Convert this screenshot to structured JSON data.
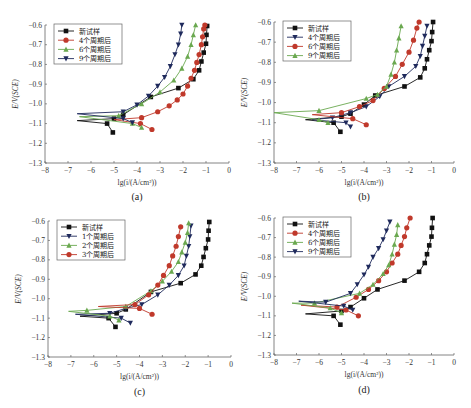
{
  "chart_data": [
    {
      "type": "line",
      "panel_label": "(a)",
      "xlabel": "lg(i/(A/cm²))",
      "ylabel": "E/V(SCE)",
      "xlim": [
        -8,
        0
      ],
      "ylim": [
        -1.3,
        -0.6
      ],
      "xticks": [
        "-8",
        "-7",
        "-6",
        "-5",
        "-4",
        "-3",
        "-2",
        "-1",
        "0"
      ],
      "yticks": [
        "-0.6",
        "-0.7",
        "-0.8",
        "-0.9",
        "-1.0",
        "-1.1",
        "-1.2",
        "-1.3"
      ],
      "legend_position": "top-left",
      "series": [
        {
          "name": "新试样",
          "color": "#111111",
          "marker": "square",
          "points": [
            [
              -5.05,
              -1.145
            ],
            [
              -5.3,
              -1.1
            ],
            [
              -6.6,
              -1.085
            ],
            [
              -5.0,
              -1.075
            ],
            [
              -4.6,
              -1.055
            ],
            [
              -3.4,
              -0.965
            ],
            [
              -2.2,
              -0.92
            ],
            [
              -1.55,
              -0.875
            ],
            [
              -1.3,
              -0.83
            ],
            [
              -1.2,
              -0.785
            ],
            [
              -1.1,
              -0.74
            ],
            [
              -1.0,
              -0.695
            ],
            [
              -0.98,
              -0.65
            ],
            [
              -0.95,
              -0.605
            ]
          ]
        },
        {
          "name": "4个周期后",
          "color": "#c0392b",
          "marker": "circle",
          "points": [
            [
              -3.35,
              -1.13
            ],
            [
              -3.85,
              -1.1
            ],
            [
              -5.0,
              -1.08
            ],
            [
              -3.8,
              -1.07
            ],
            [
              -3.1,
              -1.04
            ],
            [
              -2.6,
              -1.01
            ],
            [
              -2.25,
              -0.98
            ],
            [
              -2.0,
              -0.95
            ],
            [
              -1.8,
              -0.91
            ],
            [
              -1.65,
              -0.87
            ],
            [
              -1.5,
              -0.83
            ],
            [
              -1.4,
              -0.79
            ],
            [
              -1.3,
              -0.75
            ],
            [
              -1.2,
              -0.7
            ],
            [
              -1.15,
              -0.66
            ],
            [
              -1.1,
              -0.62
            ],
            [
              -1.05,
              -0.6
            ]
          ]
        },
        {
          "name": "6个周期后",
          "color": "#6aa84f",
          "marker": "triangle-up",
          "points": [
            [
              -3.8,
              -1.12
            ],
            [
              -4.2,
              -1.1
            ],
            [
              -6.5,
              -1.065
            ],
            [
              -4.8,
              -1.06
            ],
            [
              -3.8,
              -1.0
            ],
            [
              -3.0,
              -0.94
            ],
            [
              -2.4,
              -0.88
            ],
            [
              -2.05,
              -0.82
            ],
            [
              -1.8,
              -0.76
            ],
            [
              -1.65,
              -0.7
            ],
            [
              -1.55,
              -0.65
            ],
            [
              -1.45,
              -0.6
            ]
          ]
        },
        {
          "name": "9个周期后",
          "color": "#1f2a5c",
          "marker": "triangle-down",
          "points": [
            [
              -4.2,
              -1.095
            ],
            [
              -4.6,
              -1.075
            ],
            [
              -6.6,
              -1.05
            ],
            [
              -4.6,
              -1.04
            ],
            [
              -4.0,
              -1.005
            ],
            [
              -3.5,
              -0.96
            ],
            [
              -3.1,
              -0.91
            ],
            [
              -2.8,
              -0.865
            ],
            [
              -2.55,
              -0.81
            ],
            [
              -2.35,
              -0.75
            ],
            [
              -2.2,
              -0.7
            ],
            [
              -2.1,
              -0.645
            ],
            [
              -2.05,
              -0.6
            ]
          ]
        }
      ]
    },
    {
      "type": "line",
      "panel_label": "(b)",
      "xlabel": "lg(i/(A/cm²))",
      "ylabel": "E/V(SCE)",
      "xlim": [
        -8,
        0
      ],
      "ylim": [
        -1.3,
        -0.6
      ],
      "xticks": [
        "-8",
        "-7",
        "-6",
        "-5",
        "-4",
        "-3",
        "-2",
        "-1",
        "0"
      ],
      "yticks": [
        "-0.6",
        "-0.7",
        "-0.8",
        "-0.9",
        "-1.0",
        "-1.1",
        "-1.2",
        "-1.3"
      ],
      "legend_position": "top-left",
      "series": [
        {
          "name": "新试样",
          "color": "#111111",
          "marker": "square",
          "points": [
            [
              -5.05,
              -1.145
            ],
            [
              -5.35,
              -1.1
            ],
            [
              -6.6,
              -1.085
            ],
            [
              -5.0,
              -1.07
            ],
            [
              -4.6,
              -1.055
            ],
            [
              -4.0,
              -1.01
            ],
            [
              -3.5,
              -0.965
            ],
            [
              -2.2,
              -0.92
            ],
            [
              -1.5,
              -0.875
            ],
            [
              -1.3,
              -0.83
            ],
            [
              -1.2,
              -0.785
            ],
            [
              -1.1,
              -0.74
            ],
            [
              -1.0,
              -0.695
            ],
            [
              -0.97,
              -0.65
            ],
            [
              -0.93,
              -0.6
            ]
          ]
        },
        {
          "name": "4个周期后",
          "color": "#1f2a5c",
          "marker": "triangle-down",
          "points": [
            [
              -4.6,
              -1.12
            ],
            [
              -4.8,
              -1.1
            ],
            [
              -6.3,
              -1.085
            ],
            [
              -5.4,
              -1.075
            ],
            [
              -4.6,
              -1.05
            ],
            [
              -3.9,
              -1.02
            ],
            [
              -3.3,
              -0.97
            ],
            [
              -2.9,
              -0.92
            ],
            [
              -2.2,
              -0.87
            ],
            [
              -1.7,
              -0.82
            ],
            [
              -1.5,
              -0.77
            ],
            [
              -1.4,
              -0.72
            ],
            [
              -1.3,
              -0.67
            ],
            [
              -1.2,
              -0.62
            ]
          ]
        },
        {
          "name": "6个周期后",
          "color": "#c0392b",
          "marker": "circle",
          "points": [
            [
              -3.9,
              -1.11
            ],
            [
              -4.5,
              -1.08
            ],
            [
              -6.3,
              -1.06
            ],
            [
              -5.0,
              -1.05
            ],
            [
              -4.2,
              -1.02
            ],
            [
              -3.6,
              -0.99
            ],
            [
              -3.1,
              -0.93
            ],
            [
              -2.6,
              -0.87
            ],
            [
              -2.3,
              -0.81
            ],
            [
              -2.0,
              -0.75
            ],
            [
              -1.8,
              -0.69
            ],
            [
              -1.65,
              -0.63
            ],
            [
              -1.55,
              -0.6
            ]
          ]
        },
        {
          "name": "9个周期后",
          "color": "#6aa84f",
          "marker": "triangle-up",
          "points": [
            [
              -5.6,
              -1.1
            ],
            [
              -6.0,
              -1.085
            ],
            [
              -8.0,
              -1.05
            ],
            [
              -6.0,
              -1.04
            ],
            [
              -3.9,
              -0.98
            ],
            [
              -3.4,
              -0.96
            ],
            [
              -3.0,
              -0.92
            ],
            [
              -2.8,
              -0.86
            ],
            [
              -2.65,
              -0.8
            ],
            [
              -2.55,
              -0.74
            ],
            [
              -2.45,
              -0.68
            ],
            [
              -2.35,
              -0.62
            ]
          ]
        }
      ]
    },
    {
      "type": "line",
      "panel_label": "(c)",
      "xlabel": "lg(i/(A/cm²))",
      "ylabel": "E/V(SCE)",
      "xlim": [
        -8,
        0
      ],
      "ylim": [
        -1.3,
        -0.6
      ],
      "xticks": [
        "-8",
        "-7",
        "-6",
        "-5",
        "-4",
        "-3",
        "-2",
        "-1",
        "0"
      ],
      "yticks": [
        "-0.6",
        "-0.7",
        "-0.8",
        "-0.9",
        "-1.0",
        "-1.1",
        "-1.2",
        "-1.3"
      ],
      "legend_position": "top-left",
      "series": [
        {
          "name": "新试样",
          "color": "#111111",
          "marker": "square",
          "points": [
            [
              -5.05,
              -1.145
            ],
            [
              -5.35,
              -1.1
            ],
            [
              -6.6,
              -1.09
            ],
            [
              -5.0,
              -1.075
            ],
            [
              -4.6,
              -1.055
            ],
            [
              -3.5,
              -0.965
            ],
            [
              -2.2,
              -0.92
            ],
            [
              -1.55,
              -0.875
            ],
            [
              -1.3,
              -0.83
            ],
            [
              -1.2,
              -0.785
            ],
            [
              -1.1,
              -0.74
            ],
            [
              -1.0,
              -0.695
            ],
            [
              -0.98,
              -0.65
            ],
            [
              -0.95,
              -0.605
            ]
          ]
        },
        {
          "name": "1个周期后",
          "color": "#1f2a5c",
          "marker": "triangle-down",
          "points": [
            [
              -4.4,
              -1.125
            ],
            [
              -4.8,
              -1.1
            ],
            [
              -6.8,
              -1.08
            ],
            [
              -5.3,
              -1.075
            ],
            [
              -4.6,
              -1.05
            ],
            [
              -3.9,
              -1.03
            ],
            [
              -3.2,
              -0.98
            ],
            [
              -2.7,
              -0.93
            ],
            [
              -2.3,
              -0.88
            ],
            [
              -2.05,
              -0.83
            ],
            [
              -1.95,
              -0.78
            ],
            [
              -1.85,
              -0.73
            ],
            [
              -1.8,
              -0.68
            ],
            [
              -1.75,
              -0.625
            ]
          ]
        },
        {
          "name": "2个周期后",
          "color": "#6aa84f",
          "marker": "triangle-up",
          "points": [
            [
              -4.9,
              -1.11
            ],
            [
              -5.3,
              -1.09
            ],
            [
              -7.1,
              -1.065
            ],
            [
              -6.3,
              -1.06
            ],
            [
              -4.6,
              -1.04
            ],
            [
              -3.5,
              -0.96
            ],
            [
              -3.0,
              -0.91
            ],
            [
              -2.6,
              -0.86
            ],
            [
              -2.3,
              -0.81
            ],
            [
              -2.15,
              -0.76
            ],
            [
              -2.0,
              -0.71
            ],
            [
              -1.9,
              -0.66
            ],
            [
              -1.85,
              -0.61
            ]
          ]
        },
        {
          "name": "3个周期后",
          "color": "#c0392b",
          "marker": "circle",
          "points": [
            [
              -3.45,
              -1.08
            ],
            [
              -4.0,
              -1.05
            ],
            [
              -5.8,
              -1.04
            ],
            [
              -4.2,
              -1.03
            ],
            [
              -3.6,
              -0.98
            ],
            [
              -3.2,
              -0.93
            ],
            [
              -2.95,
              -0.88
            ],
            [
              -2.7,
              -0.83
            ],
            [
              -2.55,
              -0.78
            ],
            [
              -2.4,
              -0.73
            ],
            [
              -2.3,
              -0.68
            ],
            [
              -2.2,
              -0.63
            ]
          ]
        }
      ]
    },
    {
      "type": "line",
      "panel_label": "(d)",
      "xlabel": "lg(i/(A/cm²))",
      "ylabel": "E/V(SCE)",
      "xlim": [
        -8,
        0
      ],
      "ylim": [
        -1.3,
        -0.6
      ],
      "xticks": [
        "-8",
        "-7",
        "-6",
        "-5",
        "-4",
        "-3",
        "-2",
        "-1",
        "0"
      ],
      "yticks": [
        "-0.6",
        "-0.7",
        "-0.8",
        "-0.9",
        "-1.0",
        "-1.1",
        "-1.2",
        "-1.3"
      ],
      "legend_position": "top-left",
      "series": [
        {
          "name": "新试样",
          "color": "#111111",
          "marker": "square",
          "points": [
            [
              -5.05,
              -1.145
            ],
            [
              -5.35,
              -1.1
            ],
            [
              -6.6,
              -1.09
            ],
            [
              -5.0,
              -1.075
            ],
            [
              -4.6,
              -1.055
            ],
            [
              -4.0,
              -1.01
            ],
            [
              -3.4,
              -0.965
            ],
            [
              -2.2,
              -0.92
            ],
            [
              -1.55,
              -0.875
            ],
            [
              -1.3,
              -0.83
            ],
            [
              -1.2,
              -0.785
            ],
            [
              -1.1,
              -0.74
            ],
            [
              -1.0,
              -0.695
            ],
            [
              -0.98,
              -0.65
            ],
            [
              -0.95,
              -0.6
            ]
          ]
        },
        {
          "name": "4个周期后",
          "color": "#c0392b",
          "marker": "circle",
          "points": [
            [
              -4.25,
              -1.1
            ],
            [
              -4.8,
              -1.07
            ],
            [
              -6.8,
              -1.045
            ],
            [
              -5.2,
              -1.055
            ],
            [
              -4.35,
              -1.005
            ],
            [
              -3.8,
              -0.965
            ],
            [
              -3.35,
              -0.92
            ],
            [
              -3.0,
              -0.875
            ],
            [
              -2.75,
              -0.83
            ],
            [
              -2.5,
              -0.785
            ],
            [
              -2.35,
              -0.74
            ],
            [
              -2.2,
              -0.695
            ],
            [
              -2.1,
              -0.65
            ],
            [
              -1.95,
              -0.6
            ]
          ]
        },
        {
          "name": "6个周期后",
          "color": "#6aa84f",
          "marker": "triangle-up",
          "points": [
            [
              -5.0,
              -1.085
            ],
            [
              -5.5,
              -1.06
            ],
            [
              -7.2,
              -1.035
            ],
            [
              -6.2,
              -1.035
            ],
            [
              -4.2,
              -0.985
            ],
            [
              -3.6,
              -0.94
            ],
            [
              -3.15,
              -0.885
            ],
            [
              -2.9,
              -0.84
            ],
            [
              -2.75,
              -0.785
            ],
            [
              -2.65,
              -0.735
            ],
            [
              -2.55,
              -0.685
            ],
            [
              -2.5,
              -0.635
            ]
          ]
        },
        {
          "name": "9个周期后",
          "color": "#1f2a5c",
          "marker": "triangle-down",
          "points": [
            [
              -4.5,
              -1.07
            ],
            [
              -4.9,
              -1.05
            ],
            [
              -6.9,
              -1.025
            ],
            [
              -5.7,
              -1.03
            ],
            [
              -4.6,
              -0.985
            ],
            [
              -4.3,
              -0.94
            ],
            [
              -4.0,
              -0.89
            ],
            [
              -3.8,
              -0.85
            ],
            [
              -3.6,
              -0.8
            ],
            [
              -3.35,
              -0.755
            ],
            [
              -3.15,
              -0.71
            ],
            [
              -3.0,
              -0.665
            ],
            [
              -2.85,
              -0.62
            ]
          ]
        }
      ]
    }
  ]
}
